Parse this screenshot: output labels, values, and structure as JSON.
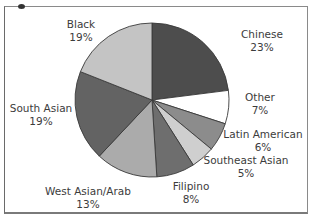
{
  "chart_data": {
    "type": "pie",
    "title": "",
    "start_angle_deg": 0,
    "direction": "clockwise",
    "slices": [
      {
        "label": "Chinese",
        "value": 23,
        "display": "23%",
        "color": "#4d4d4d"
      },
      {
        "label": "Other",
        "value": 7,
        "display": "7%",
        "color": "#ffffff"
      },
      {
        "label": "Latin American",
        "value": 6,
        "display": "6%",
        "color": "#8c8c8c"
      },
      {
        "label": "Southeast Asian",
        "value": 5,
        "display": "5%",
        "color": "#cfcfcf"
      },
      {
        "label": "Filipino",
        "value": 8,
        "display": "8%",
        "color": "#6e6e6e"
      },
      {
        "label": "West Asian/Arab",
        "value": 13,
        "display": "13%",
        "color": "#ababab"
      },
      {
        "label": "South Asian",
        "value": 19,
        "display": "19%",
        "color": "#636363"
      },
      {
        "label": "Black",
        "value": 19,
        "display": "19%",
        "color": "#c4c4c4"
      }
    ],
    "legend": "none (direct labels)"
  },
  "labels": [
    {
      "name": "Chinese",
      "pct": "23%",
      "x": 262,
      "y": 28
    },
    {
      "name": "Other",
      "pct": "7%",
      "x": 260,
      "y": 91
    },
    {
      "name": "Latin American",
      "pct": "6%",
      "x": 263,
      "y": 128
    },
    {
      "name": "Southeast Asian",
      "pct": "5%",
      "x": 246,
      "y": 154
    },
    {
      "name": "Filipino",
      "pct": "8%",
      "x": 191,
      "y": 180
    },
    {
      "name": "West Asian/Arab",
      "pct": "13%",
      "x": 88,
      "y": 185
    },
    {
      "name": "South Asian",
      "pct": "19%",
      "x": 41,
      "y": 102
    },
    {
      "name": "Black",
      "pct": "19%",
      "x": 81,
      "y": 18
    }
  ]
}
